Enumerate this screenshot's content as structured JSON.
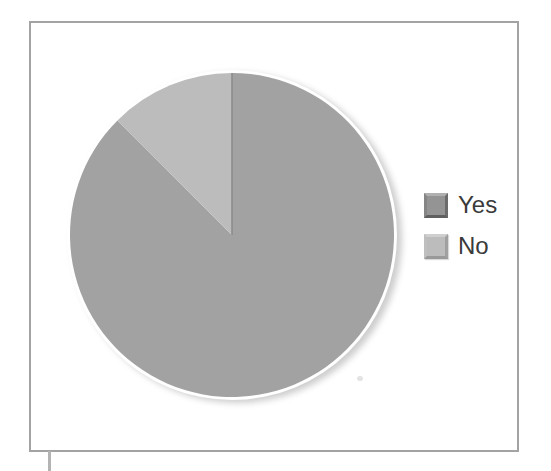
{
  "figure": {
    "background_color": "#ffffff",
    "frame_border_color": "#a3a3a3",
    "artifact_line_color": "#b3b3b3"
  },
  "chart_data": {
    "type": "pie",
    "title": "",
    "series": [
      {
        "label": "Yes",
        "value": 87.5,
        "color": "#a2a2a2"
      },
      {
        "label": "No",
        "value": 12.5,
        "color": "#bcbcbc"
      }
    ],
    "unit": "percent",
    "start_angle_deg": 0,
    "direction": "clockwise",
    "divider_line_color": "#8c8c8c",
    "white_rim_color": "#ffffff",
    "legend_position": "right",
    "legend": [
      {
        "label": "Yes",
        "swatch_color": "#949494"
      },
      {
        "label": "No",
        "swatch_color": "#bcbcbc"
      }
    ]
  }
}
